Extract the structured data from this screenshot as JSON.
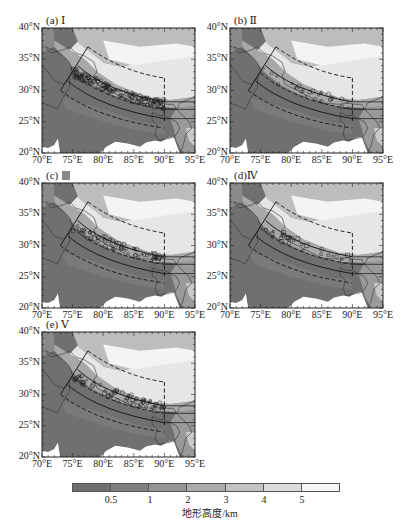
{
  "figure": {
    "panels": [
      {
        "id": "a",
        "label": "(a) Ⅰ",
        "left": 42,
        "top": 28,
        "density": "high"
      },
      {
        "id": "b",
        "label": "(b) Ⅱ",
        "left": 230,
        "top": 28,
        "density": "low"
      },
      {
        "id": "c",
        "label": "(c) ",
        "label_glyph_box": true,
        "left": 42,
        "top": 183,
        "density": "medium"
      },
      {
        "id": "d",
        "label": "(d)Ⅳ",
        "left": 230,
        "top": 183,
        "density": "low"
      },
      {
        "id": "e",
        "label": "(e) Ⅴ",
        "left": 42,
        "top": 332,
        "density": "medium"
      }
    ],
    "y_ticks": [
      "40°N",
      "35°N",
      "30°N",
      "25°N",
      "20°N"
    ],
    "x_ticks": [
      "70°E",
      "75°E",
      "80°E",
      "85°E",
      "90°E",
      "95°E"
    ],
    "colorbar": {
      "title": "地形高度/km",
      "ticks": [
        "0.5",
        "1",
        "2",
        "3",
        "4",
        "5"
      ],
      "colors": [
        "#6e6e6e",
        "#7f7f7f",
        "#959595",
        "#ababab",
        "#c3c3c3",
        "#dcdcdc",
        "#f6f6f6"
      ]
    }
  },
  "chart_data": {
    "type": "map",
    "title": "",
    "panels": [
      "(a) Ⅰ",
      "(b) Ⅱ",
      "(c) Ⅲ",
      "(d) Ⅳ",
      "(e) Ⅴ"
    ],
    "lon_range": [
      70,
      95
    ],
    "lat_range": [
      20,
      40
    ],
    "xlabel_ticks": [
      "70°E",
      "75°E",
      "80°E",
      "85°E",
      "90°E",
      "95°E"
    ],
    "ylabel_ticks": [
      "20°N",
      "25°N",
      "30°N",
      "35°N",
      "40°N"
    ],
    "fill": "terrain height (km), grayscale",
    "colorbar_label": "地形高度/km",
    "colorbar_levels": [
      0.5,
      1,
      2,
      3,
      4,
      5
    ],
    "overlays": [
      "dashed outer arc boundary (≈77.5°E,37°N → 90°E,32°N, vertical at 90°E)",
      "solid arc bands along Himalayan southern slope (≈74–90°E, 26–34°N)",
      "dashed southern arc (≈73°E,30°N → 90°E,24°N)",
      "open-circle/square markers of event locations clustered along the Himalayan foothills"
    ]
  }
}
